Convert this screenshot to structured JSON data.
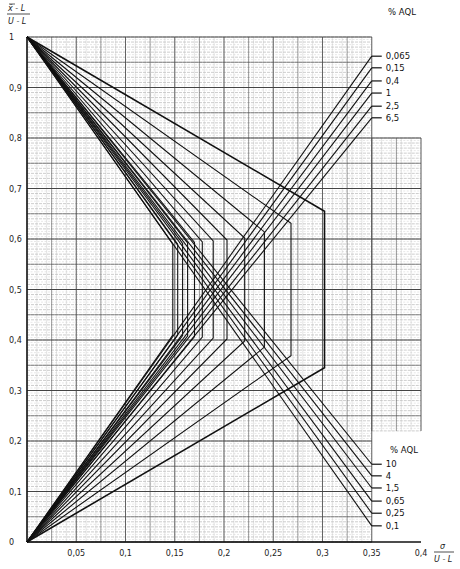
{
  "chart_data": {
    "type": "line",
    "title": "",
    "ylabel": "(x̄ − L) / (U − L)",
    "ylabel_numerator": "x̄ - L",
    "ylabel_denominator": "U - L",
    "xlabel": "σ / (U − L)",
    "xlabel_numerator": "σ",
    "xlabel_denominator": "U - L",
    "xlim": [
      0,
      0.4
    ],
    "ylim": [
      0,
      1
    ],
    "grid": true,
    "x_ticks": [
      {
        "value": 0.05,
        "label": "0,05"
      },
      {
        "value": 0.1,
        "label": "0,1"
      },
      {
        "value": 0.15,
        "label": "0,15"
      },
      {
        "value": 0.2,
        "label": "0,2"
      },
      {
        "value": 0.25,
        "label": "0,25"
      },
      {
        "value": 0.3,
        "label": "0,3"
      },
      {
        "value": 0.35,
        "label": "0,35"
      },
      {
        "value": 0.4,
        "label": "0,4"
      }
    ],
    "y_ticks": [
      {
        "value": 0,
        "label": "0"
      },
      {
        "value": 0.1,
        "label": "0,1"
      },
      {
        "value": 0.2,
        "label": "0,2"
      },
      {
        "value": 0.3,
        "label": "0,3"
      },
      {
        "value": 0.4,
        "label": "0,4"
      },
      {
        "value": 0.5,
        "label": "0,5"
      },
      {
        "value": 0.6,
        "label": "0,6"
      },
      {
        "value": 0.7,
        "label": "0,7"
      },
      {
        "value": 0.8,
        "label": "0,8"
      },
      {
        "value": 0.9,
        "label": "0,9"
      },
      {
        "value": 1,
        "label": "1"
      }
    ],
    "series": [
      {
        "name": "0,1",
        "vertical_x": 0.302,
        "upper_bend_y": 0.655,
        "lower_bend_y": 0.345
      },
      {
        "name": "0,065",
        "vertical_x": 0.268,
        "upper_bend_y": 0.631,
        "lower_bend_y": 0.369
      },
      {
        "name": "0,25",
        "vertical_x": 0.241,
        "upper_bend_y": 0.614,
        "lower_bend_y": 0.386
      },
      {
        "name": "0,15",
        "vertical_x": 0.221,
        "upper_bend_y": 0.602,
        "lower_bend_y": 0.398
      },
      {
        "name": "0,65",
        "vertical_x": 0.203,
        "upper_bend_y": 0.598,
        "lower_bend_y": 0.402
      },
      {
        "name": "0,4",
        "vertical_x": 0.189,
        "upper_bend_y": 0.596,
        "lower_bend_y": 0.404
      },
      {
        "name": "1,5",
        "vertical_x": 0.178,
        "upper_bend_y": 0.594,
        "lower_bend_y": 0.406
      },
      {
        "name": "1",
        "vertical_x": 0.17,
        "upper_bend_y": 0.593,
        "lower_bend_y": 0.407
      },
      {
        "name": "4",
        "vertical_x": 0.163,
        "upper_bend_y": 0.592,
        "lower_bend_y": 0.408
      },
      {
        "name": "2,5",
        "vertical_x": 0.158,
        "upper_bend_y": 0.591,
        "lower_bend_y": 0.409
      },
      {
        "name": "10",
        "vertical_x": 0.153,
        "upper_bend_y": 0.59,
        "lower_bend_y": 0.41
      },
      {
        "name": "6,5",
        "vertical_x": 0.148,
        "upper_bend_y": 0.59,
        "lower_bend_y": 0.41
      }
    ],
    "upper_legend": {
      "title": "% AQL",
      "note": "lines from (0,0) ending at x=0.35",
      "entries": [
        {
          "label": "0,065",
          "y_end": 0.962
        },
        {
          "label": "0,15",
          "y_end": 0.939
        },
        {
          "label": "0,4",
          "y_end": 0.913
        },
        {
          "label": "1",
          "y_end": 0.889
        },
        {
          "label": "2,5",
          "y_end": 0.863
        },
        {
          "label": "6,5",
          "y_end": 0.84
        }
      ]
    },
    "lower_legend": {
      "title": "% AQL",
      "note": "lines from (0,1) ending at x=0.35",
      "entries": [
        {
          "label": "10",
          "y_end": 0.154
        },
        {
          "label": "4",
          "y_end": 0.131
        },
        {
          "label": "1,5",
          "y_end": 0.107
        },
        {
          "label": "0,65",
          "y_end": 0.081
        },
        {
          "label": "0,25",
          "y_end": 0.057
        },
        {
          "label": "0,1",
          "y_end": 0.032
        }
      ]
    }
  }
}
